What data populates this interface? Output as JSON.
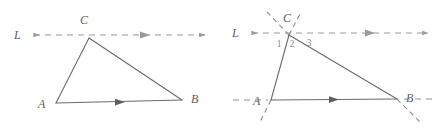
{
  "figure": {
    "background_color": "#ffffff",
    "solid_stroke_color": "#6b6b6b",
    "dashed_stroke_color": "#9a9a9a",
    "label_color": "#5e5e5e",
    "angle_label_color": "#8a8a8a",
    "panels": [
      {
        "id": "left-panel",
        "name": "triangle-with-parallel-line",
        "line_label": "L",
        "vertex_labels": {
          "A": "A",
          "B": "B",
          "C": "C"
        },
        "vertices": {
          "A": [
            56,
            103
          ],
          "B": [
            182,
            100
          ],
          "C": [
            89,
            38
          ]
        },
        "parallel_line": {
          "label": "L",
          "y": 35,
          "x_start": 30,
          "x_end": 207,
          "arrow_left": true,
          "arrow_right": true,
          "arrow_mid_x": 145
        },
        "segment_ab_arrow_x": 120,
        "angle_labels": []
      },
      {
        "id": "right-panel",
        "name": "triangle-with-parallel-line-and-transversals",
        "line_label": "L",
        "vertex_labels": {
          "A": "A",
          "B": "B",
          "C": "C"
        },
        "vertices": {
          "A": [
            271,
            100
          ],
          "B": [
            397,
            99
          ],
          "C": [
            289,
            35
          ]
        },
        "parallel_line": {
          "label": "L",
          "y": 33,
          "x_start": 248,
          "x_end": 430,
          "arrow_left": true,
          "arrow_right": true,
          "arrow_mid_x": 370
        },
        "segment_ab_arrow_x": 334,
        "angle_labels": [
          "1",
          "2",
          "3"
        ],
        "angle_label_positions": [
          [
            279,
            47
          ],
          [
            292,
            47
          ],
          [
            309,
            46
          ]
        ],
        "transversal_extensions": {
          "ca_up_left": true,
          "cb_up_right": true,
          "ca_down_below_a": true,
          "cb_down_past_b": true,
          "ab_left_of_a": true,
          "ab_right_of_b": true
        }
      }
    ]
  }
}
